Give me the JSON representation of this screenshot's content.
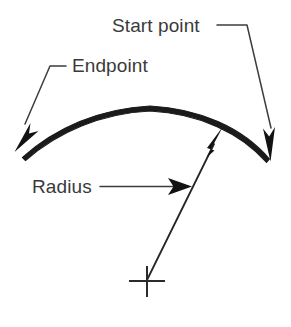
{
  "diagram": {
    "background_color": "#ffffff",
    "ink_color": "#1b1b1b",
    "text_color": "#3a3a3a",
    "width": 291,
    "height": 327,
    "labels": {
      "start_point": "Start point",
      "endpoint": "Endpoint",
      "radius": "Radius"
    },
    "annotations": [
      {
        "name": "start-point",
        "text": "Start point",
        "text_x": 112,
        "text_y": 32,
        "leader": "elbow-down-right",
        "points_to": "arc-right-end"
      },
      {
        "name": "endpoint",
        "text": "Endpoint",
        "text_x": 72,
        "text_y": 72,
        "leader": "elbow-down-left",
        "points_to": "arc-left-end"
      },
      {
        "name": "radius",
        "text": "Radius",
        "text_x": 32,
        "text_y": 193,
        "leader": "straight-right",
        "points_to": "radius-line"
      }
    ],
    "geometry": {
      "arc": {
        "start_x": 270,
        "start_y": 160,
        "apex_x": 150,
        "apex_y": 106,
        "end_x": 22,
        "end_y": 157,
        "stroke_width": 4
      },
      "center_mark": {
        "x": 147,
        "y": 281,
        "h_span": 36,
        "v_span": 30
      },
      "radius_line": {
        "from_x": 147,
        "from_y": 281,
        "to_x": 222,
        "to_y": 128
      }
    }
  }
}
